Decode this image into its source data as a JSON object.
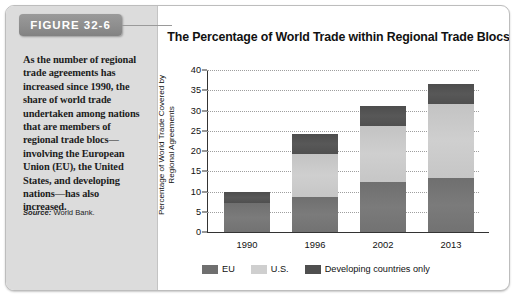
{
  "figure": {
    "tab_label": "FIGURE 32-6",
    "caption": "As the number of regional trade agreements has increased since 1990, the share of world trade undertaken among nations that are members of regional trade blocs—involving the European Union (EU), the United States, and developing nations—has also increased.",
    "source_word": "Source:",
    "source_text": " World Bank."
  },
  "chart_data": {
    "type": "bar",
    "stacked": true,
    "title": "The Percentage of World Trade within Regional Trade Blocs",
    "xlabel": "",
    "ylabel": "Percentage of World Trade Covered by Regional Agreements",
    "categories": [
      "1990",
      "1996",
      "2002",
      "2013"
    ],
    "series": [
      {
        "name": "EU",
        "color": "#737373",
        "values": [
          7.1,
          8.7,
          12.4,
          13.4
        ]
      },
      {
        "name": "U.S.",
        "color": "#cfcfcf",
        "values": [
          0.0,
          10.6,
          13.8,
          18.1
        ]
      },
      {
        "name": "Developing countries only",
        "color": "#4f4f4f",
        "values": [
          2.9,
          5.0,
          4.8,
          5.0
        ]
      }
    ],
    "totals": [
      10.0,
      24.3,
      31.0,
      36.5
    ],
    "ylim": [
      0,
      40
    ],
    "yticks": [
      0,
      5,
      10,
      15,
      20,
      25,
      30,
      35,
      40
    ],
    "grid": true,
    "legend_position": "bottom"
  }
}
